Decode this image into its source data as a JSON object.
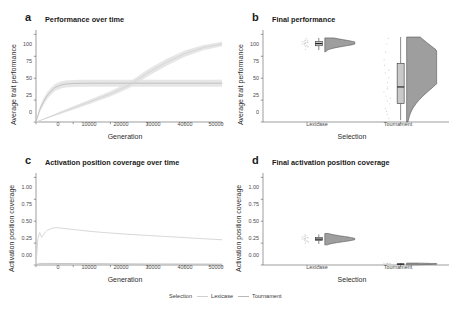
{
  "figure": {
    "background": "#ffffff",
    "panel_background": "#ffffff",
    "axis_color": "#5a5a5a"
  },
  "legend": {
    "title": "Selection",
    "position": "bottom-center",
    "items": [
      {
        "label": "Lexicase",
        "color": "#d0d0d0"
      },
      {
        "label": "Tournament",
        "color": "#b8b8b8"
      }
    ]
  },
  "colors": {
    "lexicase_line": "#d4d4d4",
    "tournament_line": "#bdbdbd",
    "violin_fill": "#9e9e9e",
    "violin_stroke": "#4a4a4a",
    "box_fill": "#c9c9c9",
    "box_stroke": "#3a3a3a",
    "point_color": "#cfcfcf",
    "ribbon_fill": "#e2e2e2"
  },
  "panels": {
    "a": {
      "tag": "a",
      "title": "Performance over time",
      "xlabel": "Generation",
      "ylabel": "Average trait performance",
      "xticks": [
        "0",
        "10000",
        "20000",
        "30000",
        "40000",
        "50000"
      ],
      "yticks": [
        "0",
        "25",
        "50",
        "75",
        "100"
      ]
    },
    "b": {
      "tag": "b",
      "title": "Final performance",
      "xlabel": "Selection",
      "ylabel": "Average trait performance",
      "xticks": [
        "Lexicase",
        "Tournament"
      ],
      "yticks": [
        "0",
        "25",
        "50",
        "75",
        "100"
      ]
    },
    "c": {
      "tag": "c",
      "title": "Activation position coverage over time",
      "xlabel": "Generation",
      "ylabel": "Activation position coverage",
      "xticks": [
        "0",
        "10000",
        "20000",
        "30000",
        "40000",
        "50000"
      ],
      "yticks": [
        "0.00",
        "0.25",
        "0.50",
        "0.75",
        "1.00"
      ]
    },
    "d": {
      "tag": "d",
      "title": "Final activation position coverage",
      "xlabel": "Selection",
      "ylabel": "Activation position coverage",
      "xticks": [
        "Lexicase",
        "Tournament"
      ],
      "yticks": [
        "0.00",
        "0.25",
        "0.50",
        "0.75",
        "1.00"
      ]
    }
  },
  "chart_data": [
    {
      "panel": "a",
      "type": "line",
      "title": "Performance over time",
      "xlabel": "Generation",
      "ylabel": "Average trait performance",
      "xlim": [
        0,
        50000
      ],
      "ylim": [
        0,
        105
      ],
      "grid": false,
      "legend_position": "bottom",
      "x": [
        0,
        1000,
        2000,
        3000,
        4000,
        5000,
        6000,
        7000,
        8000,
        10000,
        12500,
        15000,
        17500,
        20000,
        25000,
        30000,
        35000,
        40000,
        45000,
        50000
      ],
      "series": [
        {
          "name": "Tournament",
          "color": "#bdbdbd",
          "values": [
            0,
            14,
            23,
            30,
            35,
            39,
            41,
            42.5,
            43.3,
            44,
            44.2,
            44.3,
            44.3,
            44.3,
            44.3,
            44.3,
            44.3,
            44.3,
            44.3,
            44.3
          ],
          "ribbon_low": [
            0,
            11,
            19,
            26,
            31,
            35,
            37,
            38.5,
            39.3,
            40,
            40.2,
            40.3,
            40.3,
            40.3,
            40.3,
            40.3,
            40.3,
            40.3,
            40.3,
            40.3
          ],
          "ribbon_high": [
            0,
            17,
            27,
            34,
            39,
            43,
            45,
            46.5,
            47.3,
            48,
            48.2,
            48.3,
            48.3,
            48.3,
            48.3,
            48.3,
            48.3,
            48.3,
            48.3,
            48.3
          ]
        },
        {
          "name": "Lexicase",
          "color": "#d4d4d4",
          "values": [
            0,
            1.6,
            3.2,
            4.8,
            6.4,
            8.0,
            9.6,
            11.2,
            12.8,
            16.0,
            20.0,
            24.0,
            28.0,
            32.0,
            42.0,
            56.0,
            68.0,
            78.0,
            85.0,
            89.0
          ],
          "ribbon_low": [
            0,
            1.2,
            2.6,
            4.0,
            5.4,
            6.8,
            8.2,
            9.6,
            11.0,
            14.0,
            17.8,
            21.5,
            25.3,
            29.0,
            38.5,
            52.0,
            64.0,
            74.5,
            82.0,
            86.5
          ],
          "ribbon_high": [
            0,
            2.0,
            3.8,
            5.6,
            7.4,
            9.2,
            11.0,
            12.8,
            14.6,
            18.0,
            22.2,
            26.5,
            30.7,
            35.0,
            45.5,
            60.0,
            72.0,
            81.5,
            88.0,
            91.5
          ]
        }
      ]
    },
    {
      "panel": "b",
      "type": "raincloud",
      "title": "Final performance",
      "xlabel": "Selection",
      "ylabel": "Average trait performance",
      "ylim": [
        0,
        105
      ],
      "grid": false,
      "groups": [
        {
          "name": "Lexicase",
          "box": {
            "min": 82,
            "q1": 87,
            "median": 89.5,
            "q3": 92,
            "max": 96
          },
          "points": [
            83,
            85,
            86,
            87,
            87.5,
            88,
            88.5,
            89,
            89,
            89.5,
            90,
            90,
            90.5,
            91,
            91,
            91.5,
            92,
            92.5,
            93,
            94,
            95
          ],
          "density_peak_y": 90,
          "density_range": [
            80,
            96
          ]
        },
        {
          "name": "Tournament",
          "box": {
            "min": 2,
            "q1": 21,
            "median": 40,
            "q3": 67,
            "max": 97
          },
          "points": [
            2,
            5,
            8,
            12,
            16,
            20,
            23,
            27,
            30,
            34,
            38,
            41,
            45,
            50,
            55,
            60,
            66,
            72,
            80,
            88,
            95
          ],
          "density_peak_y": 55,
          "density_range": [
            0,
            97
          ]
        }
      ]
    },
    {
      "panel": "c",
      "type": "line",
      "title": "Activation position coverage over time",
      "xlabel": "Generation",
      "ylabel": "Activation position coverage",
      "xlim": [
        0,
        50000
      ],
      "ylim": [
        0,
        1.05
      ],
      "grid": false,
      "legend_position": "bottom",
      "x": [
        0,
        500,
        1000,
        1500,
        2000,
        2500,
        3000,
        4000,
        5000,
        6000,
        8000,
        10000,
        15000,
        20000,
        25000,
        30000,
        35000,
        40000,
        45000,
        50000
      ],
      "series": [
        {
          "name": "Lexicase",
          "color": "#d4d4d4",
          "values": [
            0.0,
            0.3,
            0.37,
            0.315,
            0.345,
            0.375,
            0.395,
            0.415,
            0.425,
            0.425,
            0.415,
            0.405,
            0.382,
            0.365,
            0.35,
            0.337,
            0.325,
            0.313,
            0.3,
            0.288
          ]
        },
        {
          "name": "Tournament",
          "color": "#bdbdbd",
          "values": [
            0.0,
            0.012,
            0.016,
            0.017,
            0.018,
            0.018,
            0.018,
            0.018,
            0.018,
            0.017,
            0.017,
            0.016,
            0.015,
            0.014,
            0.013,
            0.012,
            0.012,
            0.011,
            0.011,
            0.01
          ]
        }
      ]
    },
    {
      "panel": "d",
      "type": "raincloud",
      "title": "Final activation position coverage",
      "xlabel": "Selection",
      "ylabel": "Activation position coverage",
      "ylim": [
        0,
        1.05
      ],
      "grid": false,
      "groups": [
        {
          "name": "Lexicase",
          "box": {
            "min": 0.24,
            "q1": 0.28,
            "median": 0.295,
            "q3": 0.315,
            "max": 0.35
          },
          "points": [
            0.25,
            0.26,
            0.27,
            0.275,
            0.28,
            0.285,
            0.29,
            0.29,
            0.295,
            0.3,
            0.3,
            0.305,
            0.31,
            0.31,
            0.315,
            0.32,
            0.325,
            0.33,
            0.34
          ],
          "density_peak_y": 0.295,
          "density_range": [
            0.23,
            0.36
          ]
        },
        {
          "name": "Tournament",
          "box": {
            "min": 0.004,
            "q1": 0.008,
            "median": 0.01,
            "q3": 0.013,
            "max": 0.02
          },
          "points": [
            0.005,
            0.006,
            0.007,
            0.008,
            0.009,
            0.01,
            0.01,
            0.011,
            0.012,
            0.013,
            0.014,
            0.016,
            0.018
          ],
          "density_peak_y": 0.01,
          "density_range": [
            0.0,
            0.022
          ]
        }
      ]
    }
  ]
}
